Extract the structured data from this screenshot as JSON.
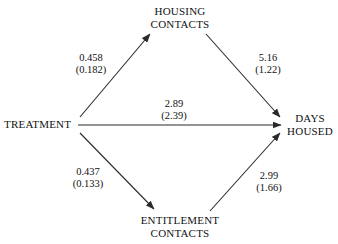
{
  "diagram": {
    "type": "path-diagram",
    "nodes": [
      {
        "id": "treatment",
        "lines": [
          "TREATMENT"
        ]
      },
      {
        "id": "housing",
        "lines": [
          "HOUSING",
          "CONTACTS"
        ]
      },
      {
        "id": "entitlement",
        "lines": [
          "ENTITLEMENT",
          "CONTACTS"
        ]
      },
      {
        "id": "days_housed",
        "lines": [
          "DAYS",
          "HOUSED"
        ]
      }
    ],
    "paths": [
      {
        "id": "a1",
        "from": "treatment",
        "to": "housing",
        "estimate": "0.458",
        "std_error": "(0.182)"
      },
      {
        "id": "b1",
        "from": "housing",
        "to": "days_housed",
        "estimate": "5.16",
        "std_error": "(1.22)"
      },
      {
        "id": "c",
        "from": "treatment",
        "to": "days_housed",
        "estimate": "2.89",
        "std_error": "(2.39)"
      },
      {
        "id": "a2",
        "from": "treatment",
        "to": "entitlement",
        "estimate": "0.437",
        "std_error": "(0.133)"
      },
      {
        "id": "b2",
        "from": "entitlement",
        "to": "days_housed",
        "estimate": "2.99",
        "std_error": "(1.66)"
      }
    ],
    "colors": {
      "background": "#ffffff",
      "text": "#111111",
      "line": "#2a2a2a"
    }
  },
  "nodes": {
    "treatment": {
      "line1": "TREATMENT"
    },
    "housing": {
      "line1": "HOUSING",
      "line2": "CONTACTS"
    },
    "entitlement": {
      "line1": "ENTITLEMENT",
      "line2": "CONTACTS"
    },
    "days_housed": {
      "line1": "DAYS",
      "line2": "HOUSED"
    }
  },
  "coefficients": {
    "a1": {
      "estimate": "0.458",
      "std_error": "(0.182)"
    },
    "b1": {
      "estimate": "5.16",
      "std_error": "(1.22)"
    },
    "c": {
      "estimate": "2.89",
      "std_error": "(2.39)"
    },
    "a2": {
      "estimate": "0.437",
      "std_error": "(0.133)"
    },
    "b2": {
      "estimate": "2.99",
      "std_error": "(1.66)"
    }
  }
}
